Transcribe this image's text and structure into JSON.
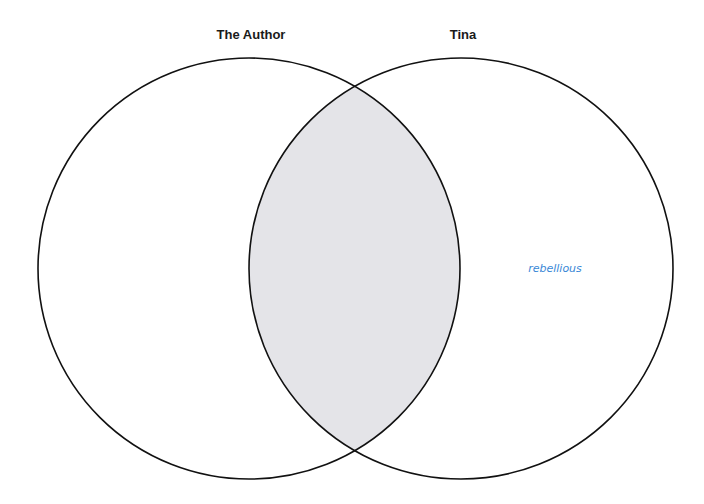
{
  "diagram": {
    "type": "venn",
    "sets": [
      {
        "label": "The Author",
        "items": []
      },
      {
        "label": "Tina",
        "items": [
          "rebellious"
        ]
      }
    ],
    "intersection": {
      "items": []
    },
    "colors": {
      "outline": "#111111",
      "intersection_fill": "#e4e4e8",
      "item_text": "#3a87d6",
      "title_text": "#1a1a1a"
    }
  }
}
